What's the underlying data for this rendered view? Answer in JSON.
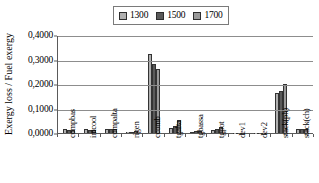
{
  "chart_data": {
    "type": "bar",
    "title": "",
    "subtitle": "",
    "xlabel": "",
    "ylabel": "Exergy loss / Fuel exergy",
    "ylim": [
      0,
      0.4
    ],
    "ytick_labels": [
      "0,4000",
      "0,3000",
      "0,2000",
      "0,1000",
      "0,0000"
    ],
    "ytick_values": [
      0.4,
      0.3,
      0.2,
      0.1,
      0.0
    ],
    "grid": true,
    "legend_position": "top-center",
    "orientation": "vertical",
    "grouping": "clustered",
    "categories": [
      "compbas",
      "intcool",
      "compalta",
      "rigen",
      "ccomb",
      "tgalta",
      "tgbassa",
      "tgpot",
      "dev1",
      "dev2",
      "stack(ph)",
      "stack(ch)"
    ],
    "series": [
      {
        "name": "1300",
        "color": "#b0b0b0",
        "values": [
          0.016,
          0.015,
          0.0175,
          0.003,
          0.322,
          0.019,
          0.006,
          0.0135,
          0.0005,
          0.0005,
          0.165,
          0.018
        ]
      },
      {
        "name": "1500",
        "color": "#5a5a5a",
        "values": [
          0.014,
          0.014,
          0.017,
          0.005,
          0.283,
          0.027,
          0.0075,
          0.0175,
          0.0005,
          0.0005,
          0.172,
          0.018
        ]
      },
      {
        "name": "1700",
        "color": "#9a9a9a",
        "values": [
          0.0135,
          0.013,
          0.017,
          0.0075,
          0.262,
          0.052,
          0.008,
          0.0235,
          0.0005,
          0.0005,
          0.2,
          0.018
        ]
      }
    ]
  }
}
